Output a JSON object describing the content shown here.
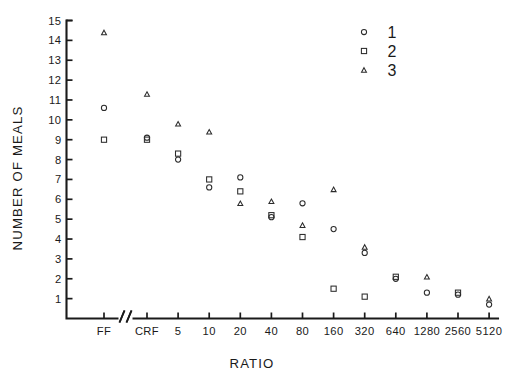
{
  "chart_data": {
    "type": "scatter",
    "title": "",
    "xlabel": "RATIO",
    "ylabel": "NUMBER OF MEALS",
    "grid": false,
    "legend_position": "top-right",
    "axis_break_after_category": "FF",
    "categories": [
      "FF",
      "CRF",
      "5",
      "10",
      "20",
      "40",
      "80",
      "160",
      "320",
      "640",
      "1280",
      "2560",
      "5120"
    ],
    "ytick_labels": [
      "1",
      "2",
      "3",
      "4",
      "5",
      "6",
      "7",
      "8",
      "9",
      "10",
      "11",
      "12",
      "13",
      "14",
      "15"
    ],
    "ytick_values": [
      1,
      2,
      3,
      4,
      5,
      6,
      7,
      8,
      9,
      10,
      11,
      12,
      13,
      14,
      15
    ],
    "ylim": [
      0,
      15
    ],
    "series": [
      {
        "name": "1",
        "marker": "circle",
        "values": [
          10.6,
          9.1,
          8.0,
          6.6,
          7.1,
          5.1,
          5.8,
          4.5,
          3.3,
          2.0,
          1.3,
          1.2,
          0.7
        ]
      },
      {
        "name": "2",
        "marker": "square",
        "values": [
          9.0,
          9.0,
          8.3,
          7.0,
          6.4,
          5.2,
          4.1,
          1.5,
          1.1,
          2.1,
          null,
          1.3,
          null
        ]
      },
      {
        "name": "3",
        "marker": "triangle",
        "values": [
          14.4,
          11.3,
          9.8,
          9.4,
          5.8,
          5.9,
          4.7,
          6.5,
          3.6,
          null,
          2.1,
          null,
          1.0
        ]
      }
    ],
    "legend": [
      {
        "label": "1",
        "marker": "circle"
      },
      {
        "label": "2",
        "marker": "square"
      },
      {
        "label": "3",
        "marker": "triangle"
      }
    ]
  }
}
